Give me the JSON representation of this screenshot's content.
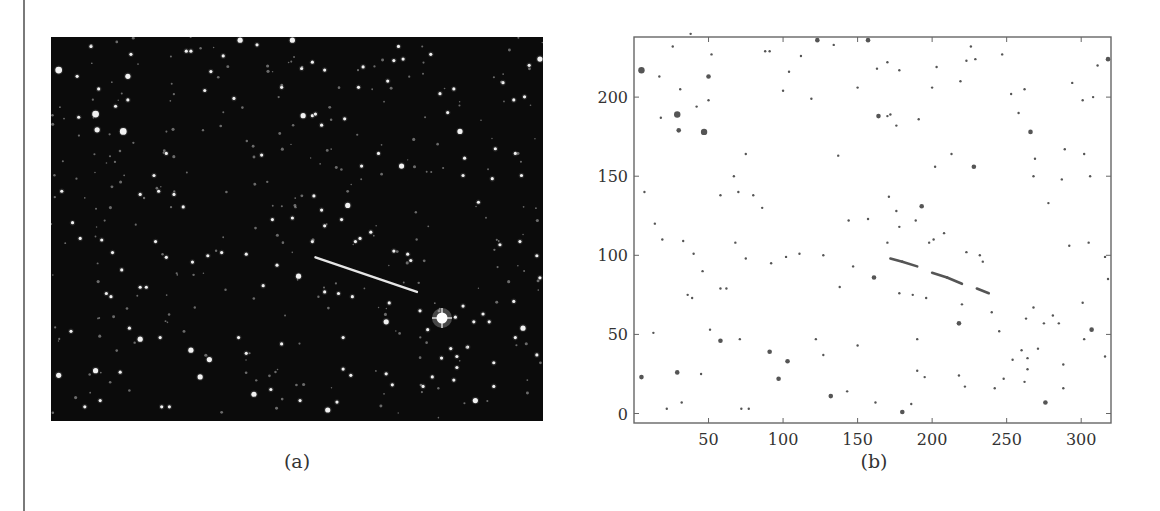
{
  "figure": {
    "panel_a": {
      "caption": "(a)",
      "description": "Night-sky star field photograph with a bright linear streak (satellite/meteor trail)"
    },
    "panel_b": {
      "caption": "(b)",
      "description": "Binarized star detections plotted on pixel axes"
    }
  },
  "chart_data": {
    "type": "scatter",
    "title": "",
    "xlabel": "",
    "ylabel": "",
    "xlim": [
      0,
      320
    ],
    "ylim": [
      -6,
      238
    ],
    "x_ticks": [
      50,
      100,
      150,
      200,
      250,
      300
    ],
    "y_ticks": [
      0,
      50,
      100,
      150,
      200
    ],
    "grid": false,
    "legend": null,
    "annotations": [
      "(b)"
    ],
    "series": [
      {
        "name": "streak",
        "type": "line",
        "x": [
          172,
          180,
          190,
          200,
          210,
          220,
          230,
          238
        ],
        "y": [
          98,
          96,
          93,
          89,
          86,
          82,
          79,
          76
        ]
      },
      {
        "name": "stars",
        "type": "scatter",
        "points": [
          [
            5,
            217,
            3
          ],
          [
            29,
            189,
            3
          ],
          [
            30,
            179,
            2
          ],
          [
            47,
            178,
            3
          ],
          [
            50,
            213,
            2
          ],
          [
            52,
            227,
            1
          ],
          [
            26,
            232,
            1
          ],
          [
            38,
            240,
            1
          ],
          [
            17,
            213,
            1
          ],
          [
            18,
            187,
            1
          ],
          [
            31,
            205,
            1
          ],
          [
            42,
            194,
            1
          ],
          [
            50,
            198,
            1
          ],
          [
            7,
            140,
            1
          ],
          [
            14,
            120,
            1
          ],
          [
            19,
            110,
            1
          ],
          [
            33,
            109,
            1
          ],
          [
            40,
            101,
            1
          ],
          [
            46,
            90,
            1
          ],
          [
            39,
            73,
            1
          ],
          [
            36,
            75,
            1
          ],
          [
            58,
            79,
            1
          ],
          [
            62,
            79,
            1
          ],
          [
            51,
            53,
            1
          ],
          [
            58,
            46,
            2
          ],
          [
            71,
            47,
            1
          ],
          [
            91,
            39,
            2
          ],
          [
            103,
            33,
            2
          ],
          [
            97,
            22,
            2
          ],
          [
            5,
            23,
            2
          ],
          [
            29,
            26,
            2
          ],
          [
            13,
            51,
            1
          ],
          [
            45,
            25,
            1
          ],
          [
            22,
            3,
            1
          ],
          [
            32,
            7,
            1
          ],
          [
            72,
            3,
            1
          ],
          [
            77,
            3,
            1
          ],
          [
            88,
            229,
            1
          ],
          [
            91,
            229,
            1
          ],
          [
            100,
            204,
            1
          ],
          [
            104,
            216,
            1
          ],
          [
            112,
            226,
            1
          ],
          [
            119,
            199,
            1
          ],
          [
            123,
            236,
            2
          ],
          [
            134,
            233,
            1
          ],
          [
            157,
            236,
            2
          ],
          [
            163,
            218,
            1
          ],
          [
            170,
            222,
            1
          ],
          [
            178,
            217,
            1
          ],
          [
            191,
            186,
            1
          ],
          [
            164,
            188,
            2
          ],
          [
            170,
            188,
            1
          ],
          [
            172,
            189,
            1
          ],
          [
            150,
            206,
            1
          ],
          [
            176,
            182,
            1
          ],
          [
            75,
            164,
            1
          ],
          [
            67,
            150,
            1
          ],
          [
            70,
            140,
            1
          ],
          [
            58,
            138,
            1
          ],
          [
            80,
            138,
            1
          ],
          [
            86,
            130,
            1
          ],
          [
            68,
            108,
            1
          ],
          [
            75,
            98,
            1
          ],
          [
            92,
            95,
            1
          ],
          [
            102,
            99,
            1
          ],
          [
            111,
            101,
            1
          ],
          [
            127,
            100,
            1
          ],
          [
            144,
            122,
            1
          ],
          [
            137,
            163,
            1
          ],
          [
            157,
            123,
            1
          ],
          [
            161,
            86,
            2
          ],
          [
            147,
            93,
            1
          ],
          [
            138,
            80,
            1
          ],
          [
            122,
            47,
            1
          ],
          [
            127,
            37,
            1
          ],
          [
            132,
            11,
            2
          ],
          [
            143,
            14,
            1
          ],
          [
            150,
            43,
            1
          ],
          [
            162,
            7,
            1
          ],
          [
            180,
            1,
            2
          ],
          [
            186,
            6,
            1
          ],
          [
            190,
            27,
            1
          ],
          [
            190,
            47,
            1
          ],
          [
            195,
            23,
            1
          ],
          [
            193,
            131,
            2
          ],
          [
            201,
            110,
            1
          ],
          [
            208,
            114,
            1
          ],
          [
            213,
            164,
            1
          ],
          [
            202,
            156,
            1
          ],
          [
            228,
            156,
            2
          ],
          [
            200,
            206,
            1
          ],
          [
            203,
            219,
            1
          ],
          [
            219,
            210,
            1
          ],
          [
            223,
            223,
            1
          ],
          [
            229,
            224,
            1
          ],
          [
            226,
            232,
            1
          ],
          [
            247,
            227,
            1
          ],
          [
            253,
            202,
            1
          ],
          [
            258,
            190,
            1
          ],
          [
            262,
            205,
            1
          ],
          [
            266,
            178,
            2
          ],
          [
            269,
            161,
            1
          ],
          [
            268,
            150,
            1
          ],
          [
            289,
            167,
            1
          ],
          [
            294,
            209,
            1
          ],
          [
            301,
            198,
            1
          ],
          [
            308,
            200,
            1
          ],
          [
            318,
            224,
            2
          ],
          [
            311,
            220,
            1
          ],
          [
            302,
            164,
            1
          ],
          [
            306,
            150,
            1
          ],
          [
            287,
            148,
            1
          ],
          [
            278,
            133,
            1
          ],
          [
            292,
            106,
            1
          ],
          [
            305,
            108,
            1
          ],
          [
            316,
            99,
            1
          ],
          [
            318,
            85,
            1
          ],
          [
            301,
            70,
            1
          ],
          [
            307,
            53,
            2
          ],
          [
            302,
            47,
            1
          ],
          [
            316,
            36,
            1
          ],
          [
            288,
            31,
            1
          ],
          [
            288,
            16,
            1
          ],
          [
            276,
            7,
            2
          ],
          [
            271,
            41,
            1
          ],
          [
            264,
            35,
            1
          ],
          [
            263,
            60,
            1
          ],
          [
            268,
            67,
            1
          ],
          [
            275,
            57,
            1
          ],
          [
            285,
            57,
            1
          ],
          [
            281,
            62,
            1
          ],
          [
            245,
            52,
            1
          ],
          [
            218,
            57,
            2
          ],
          [
            220,
            69,
            1
          ],
          [
            232,
            100,
            1
          ],
          [
            223,
            102,
            1
          ],
          [
            198,
            108,
            1
          ],
          [
            187,
            75,
            1
          ],
          [
            196,
            73,
            1
          ],
          [
            178,
            76,
            1
          ],
          [
            178,
            118,
            1
          ],
          [
            176,
            128,
            1
          ],
          [
            171,
            137,
            1
          ],
          [
            170,
            108,
            1
          ],
          [
            189,
            122,
            1
          ],
          [
            218,
            24,
            1
          ],
          [
            222,
            17,
            1
          ],
          [
            242,
            16,
            1
          ],
          [
            248,
            22,
            1
          ],
          [
            254,
            34,
            1
          ],
          [
            260,
            40,
            1
          ],
          [
            264,
            28,
            1
          ],
          [
            262,
            20,
            1
          ],
          [
            240,
            64,
            1
          ],
          [
            234,
            96,
            1
          ]
        ]
      }
    ]
  }
}
